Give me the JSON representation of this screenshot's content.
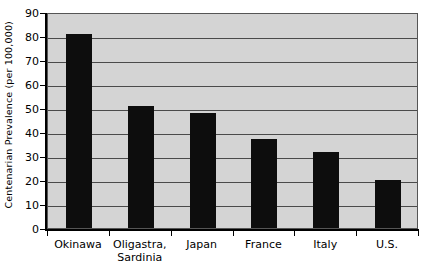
{
  "chart_data": {
    "type": "bar",
    "title": "",
    "xlabel": "",
    "ylabel": "Centenarian Prevalence (per 100,000)",
    "categories": [
      "Okinawa",
      "Oligastra, Sardinia",
      "Japan",
      "France",
      "Italy",
      "U.S."
    ],
    "category_lines": [
      [
        "Okinawa"
      ],
      [
        "Oligastra,",
        "Sardinia"
      ],
      [
        "Japan"
      ],
      [
        "France"
      ],
      [
        "Italy"
      ],
      [
        "U.S."
      ]
    ],
    "values": [
      81,
      51,
      48,
      37,
      31.5,
      20
    ],
    "ylim": [
      0,
      90
    ],
    "ytick_step": 10,
    "yticks": [
      "0",
      "10",
      "20",
      "30",
      "40",
      "50",
      "60",
      "70",
      "80",
      "90"
    ],
    "grid": "horizontal",
    "legend": "none",
    "bar_color": "#0d0d0d",
    "plot_background_color": "#d4d4d4",
    "gridline_color": "#4a4a4a",
    "axis_color": "#000000",
    "page_background_color": "#ffffff"
  }
}
